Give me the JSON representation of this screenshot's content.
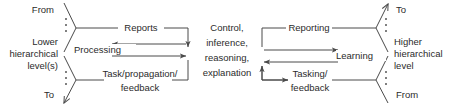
{
  "diagram": {
    "stroke_color": "#4a4a4a",
    "text_color": "#2b2b2b",
    "background": "#ffffff",
    "left_side": {
      "from_label": "From",
      "to_label": "To",
      "hierarchy_label_line1": "Lower",
      "hierarchy_label_line2": "hierarchical",
      "hierarchy_label_line3": "level(s)"
    },
    "right_side": {
      "to_label": "To",
      "from_label": "From",
      "hierarchy_label_line1": "Higher",
      "hierarchy_label_line2": "hierarchical",
      "hierarchy_label_line3": "level"
    },
    "center": {
      "line1": "Control,",
      "line2": "inference,",
      "line3": "reasoning,",
      "line4": "explanation"
    },
    "edges": {
      "reports": "Reports",
      "processing": "Processing",
      "task_propagation_line1": "Task/propagation/",
      "task_propagation_line2": "feedback",
      "reporting": "Reporting",
      "learning": "Learning",
      "tasking_line1": "Tasking/",
      "tasking_line2": "feedback"
    }
  }
}
